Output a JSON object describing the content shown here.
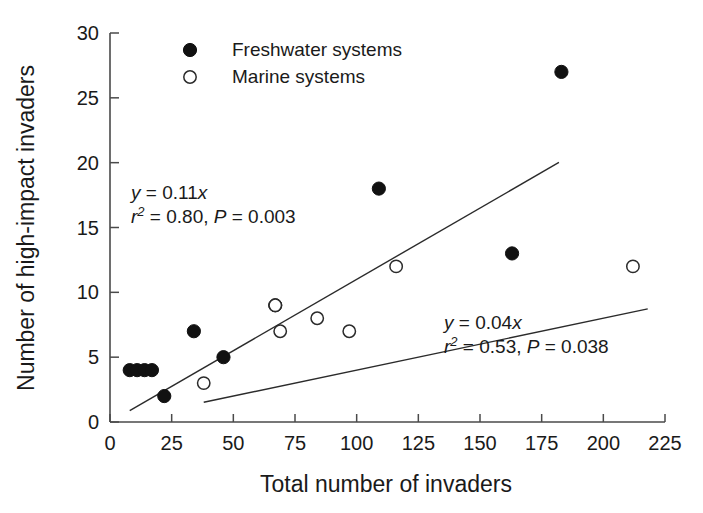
{
  "chart_data": {
    "type": "scatter",
    "title": "",
    "xlabel": "Total number of invaders",
    "ylabel": "Number of high-impact invaders",
    "xlim": [
      0,
      225
    ],
    "ylim": [
      0,
      30
    ],
    "xticks": [
      0,
      25,
      50,
      75,
      100,
      125,
      150,
      175,
      200,
      225
    ],
    "yticks": [
      0,
      5,
      10,
      15,
      20,
      25,
      30
    ],
    "grid": false,
    "legend_position": "top-left-inside",
    "series": [
      {
        "name": "Freshwater systems",
        "marker": "filled-circle",
        "color": "#111111",
        "points": [
          {
            "x": 8,
            "y": 4
          },
          {
            "x": 11,
            "y": 4
          },
          {
            "x": 14,
            "y": 4
          },
          {
            "x": 17,
            "y": 4
          },
          {
            "x": 22,
            "y": 2
          },
          {
            "x": 34,
            "y": 7
          },
          {
            "x": 46,
            "y": 5
          },
          {
            "x": 67,
            "y": 9
          },
          {
            "x": 109,
            "y": 18
          },
          {
            "x": 163,
            "y": 13
          },
          {
            "x": 183,
            "y": 27
          }
        ],
        "fit": {
          "equation": "y = 0.11x",
          "slope": 0.11,
          "r2": 0.8,
          "p": 0.003,
          "x_start": 8,
          "x_end": 182
        }
      },
      {
        "name": "Marine systems",
        "marker": "open-circle",
        "color": "#2b2b2b",
        "points": [
          {
            "x": 38,
            "y": 3
          },
          {
            "x": 67,
            "y": 9
          },
          {
            "x": 69,
            "y": 7
          },
          {
            "x": 84,
            "y": 8
          },
          {
            "x": 97,
            "y": 7
          },
          {
            "x": 116,
            "y": 12
          },
          {
            "x": 212,
            "y": 12
          }
        ],
        "fit": {
          "equation": "y = 0.04x",
          "slope": 0.04,
          "r2": 0.53,
          "p": 0.038,
          "x_start": 38,
          "x_end": 218
        }
      }
    ]
  },
  "legend": {
    "items": [
      {
        "label": "Freshwater systems",
        "marker": "filled-circle"
      },
      {
        "label": "Marine systems",
        "marker": "open-circle"
      }
    ]
  },
  "annotations": {
    "freshwater": {
      "line1_var": "y",
      "line1_rest": " = 0.11",
      "line1_x": "x",
      "line2_r": "r",
      "line2_sup": "2",
      "line2_mid": " = 0.80, ",
      "line2_p": "P",
      "line2_end": " = 0.003"
    },
    "marine": {
      "line1_var": "y",
      "line1_rest": " = 0.04",
      "line1_x": "x",
      "line2_r": "r",
      "line2_sup": "2",
      "line2_mid": " = 0.53, ",
      "line2_p": "P",
      "line2_end": " = 0.038"
    }
  },
  "axes": {
    "x_title": "Total number of invaders",
    "y_title": "Number of high-impact invaders",
    "x_tick_labels": [
      "0",
      "25",
      "50",
      "75",
      "100",
      "125",
      "150",
      "175",
      "200",
      "225"
    ],
    "y_tick_labels": [
      "0",
      "5",
      "10",
      "15",
      "20",
      "25",
      "30"
    ]
  }
}
